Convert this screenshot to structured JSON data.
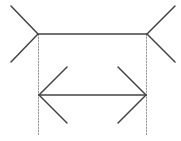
{
  "diagram": {
    "type": "muller-lyer-illusion",
    "colors": {
      "line": "#444444",
      "guide": "#999999",
      "background": "#ffffff"
    },
    "top_figure": {
      "shaft": {
        "x1": 38,
        "y1": 34,
        "x2": 147,
        "y2": 34
      },
      "left_fins": [
        {
          "x1": 38,
          "y1": 34,
          "x2": 11,
          "y2": 6
        },
        {
          "x1": 38,
          "y1": 34,
          "x2": 11,
          "y2": 62
        }
      ],
      "right_fins": [
        {
          "x1": 147,
          "y1": 34,
          "x2": 175,
          "y2": 6
        },
        {
          "x1": 147,
          "y1": 34,
          "x2": 175,
          "y2": 62
        }
      ]
    },
    "bottom_figure": {
      "shaft": {
        "x1": 39,
        "y1": 95,
        "x2": 146,
        "y2": 95
      },
      "left_fins": [
        {
          "x1": 39,
          "y1": 95,
          "x2": 67,
          "y2": 67
        },
        {
          "x1": 39,
          "y1": 95,
          "x2": 67,
          "y2": 123
        }
      ],
      "right_fins": [
        {
          "x1": 146,
          "y1": 95,
          "x2": 118,
          "y2": 67
        },
        {
          "x1": 146,
          "y1": 95,
          "x2": 118,
          "y2": 123
        }
      ]
    },
    "guides": [
      {
        "x1": 38.5,
        "y1": 34,
        "x2": 38.5,
        "y2": 135
      },
      {
        "x1": 146.5,
        "y1": 34,
        "x2": 146.5,
        "y2": 135
      }
    ]
  }
}
